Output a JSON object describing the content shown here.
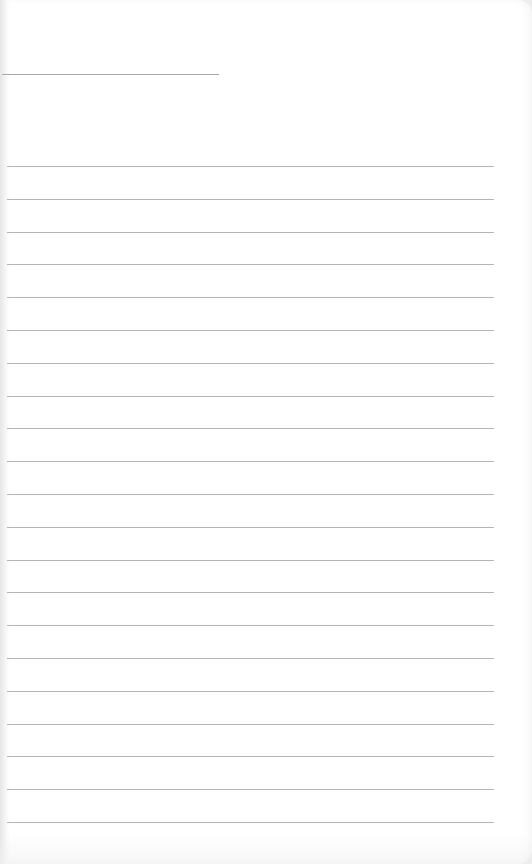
{
  "page": {
    "type": "lined-notebook-page",
    "background_color": "#ffffff",
    "rule_color": "#b4b4b4",
    "title_line": {
      "x": 2,
      "y": 74,
      "width": 217
    },
    "rules": {
      "count": 21,
      "x_start": 7,
      "x_end": 494,
      "first_y": 166,
      "spacing": 32.8
    }
  }
}
